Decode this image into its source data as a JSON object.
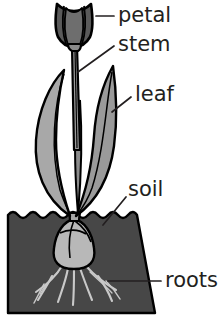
{
  "diagram": {
    "labels": [
      {
        "id": "petal",
        "text": "petal",
        "text_x": 118,
        "text_y": 16,
        "leader": "M114,16 L96,16"
      },
      {
        "id": "stem",
        "text": "stem",
        "text_x": 118,
        "text_y": 45,
        "leader": "M114,46 L78,72"
      },
      {
        "id": "leaf",
        "text": "leaf",
        "text_x": 135,
        "text_y": 95,
        "leader": "M131,97 L112,112"
      },
      {
        "id": "soil",
        "text": "soil",
        "text_x": 128,
        "text_y": 190,
        "leader": "M126,197 L103,225"
      },
      {
        "id": "roots",
        "text": "roots",
        "text_x": 165,
        "text_y": 281,
        "leader": "M161,281 L108,281"
      }
    ],
    "colors": {
      "background": "#ffffff",
      "outline": "#000000",
      "flower_dark": "#5a5a5a",
      "flower_mid": "#6e6e6e",
      "stem": "#9a9a9a",
      "leaf_light": "#a8a8a8",
      "leaf_mid": "#9a9a9a",
      "leaf_dark": "#8c8c8c",
      "soil": "#474747",
      "bulb": "#b8b8b8",
      "bulb_shade": "#a8a8a8",
      "roots": "#c9c9c9",
      "label_text": "#231f20"
    },
    "parts": [
      {
        "name": "petal",
        "description": "tulip bloom with segmented petals at top of stem"
      },
      {
        "name": "stem",
        "description": "thin vertical stalk joining bloom to bulb"
      },
      {
        "name": "leaf",
        "description": "two long curved blade leaves with midribs"
      },
      {
        "name": "soil",
        "description": "dark ground block with wavy top surface"
      },
      {
        "name": "roots",
        "description": "pale branching roots spreading below bulb"
      }
    ]
  }
}
